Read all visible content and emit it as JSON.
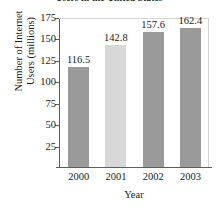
{
  "chart_data": {
    "type": "bar",
    "title": "Users in the United States",
    "xlabel": "Year",
    "ylabel_lines": [
      "Number of Internet",
      "Users (millions)"
    ],
    "ylabel": "Number of Internet Users (millions)",
    "categories": [
      "2000",
      "2001",
      "2002",
      "2003"
    ],
    "values": [
      116.5,
      142.8,
      157.6,
      162.4
    ],
    "value_labels": [
      "116.5",
      "142.8",
      "157.6",
      "162.4"
    ],
    "ylim": [
      0,
      175
    ],
    "yticks": [
      25,
      50,
      75,
      100,
      125,
      150,
      175
    ],
    "ytick_labels": [
      "25",
      "50",
      "75",
      "100",
      "125",
      "150",
      "175"
    ],
    "grid": false,
    "legend": "none",
    "bar_colors": [
      "#9a9a9a",
      "#d8d8d8",
      "#9a9a9a",
      "#9a9a9a"
    ],
    "axis_color": "#5d5d5d",
    "text_color": "#1a1a1a"
  }
}
